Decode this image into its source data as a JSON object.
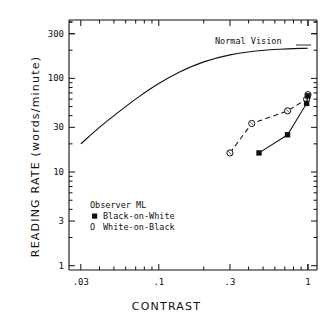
{
  "chart_data": {
    "type": "scatter",
    "title": "",
    "xlabel": "CONTRAST",
    "ylabel": "READING RATE (words/minute)",
    "xscale": "log",
    "yscale": "log",
    "xlim": [
      0.025,
      1.15
    ],
    "ylim": [
      0.9,
      420
    ],
    "grid": false,
    "xticks": [
      0.03,
      0.1,
      0.3,
      1
    ],
    "xticklabels": [
      ".03",
      ".1",
      ".3",
      "1"
    ],
    "yticks": [
      1,
      3,
      10,
      30,
      100,
      300
    ],
    "yticklabels": [
      "1",
      "3",
      "10",
      "30",
      "100",
      "300"
    ],
    "annotations": [
      {
        "text": "Normal Vision",
        "x": 0.33,
        "y": 235
      }
    ],
    "legend": {
      "position": "lower-left-inside",
      "header": "Observer ML",
      "entries": [
        {
          "marker": "filled-square",
          "label": "Black-on-White"
        },
        {
          "marker": "open-circle",
          "label": "White-on-Black",
          "glyph": "O"
        }
      ]
    },
    "series": [
      {
        "name": "Normal Vision",
        "style": "solid-line-no-markers",
        "x": [
          0.03,
          0.04,
          0.055,
          0.075,
          0.1,
          0.14,
          0.2,
          0.3,
          0.45,
          0.65,
          1.0
        ],
        "y": [
          20,
          30,
          45,
          65,
          88,
          118,
          150,
          178,
          196,
          205,
          210
        ]
      },
      {
        "name": "White-on-Black",
        "style": "dashed-line-open-circles",
        "x": [
          0.3,
          0.42,
          0.73,
          0.98,
          1.0
        ],
        "y": [
          16,
          33,
          45,
          60,
          67
        ]
      },
      {
        "name": "Black-on-White",
        "style": "solid-line-filled-squares",
        "x": [
          0.47,
          0.73,
          0.98,
          1.0
        ],
        "y": [
          16,
          25,
          54,
          65
        ]
      }
    ],
    "colors": {
      "axis": "#000000",
      "normal_vision": "#000000",
      "white_on_black": "#000000",
      "black_on_white": "#000000",
      "background": "#ffffff"
    }
  }
}
